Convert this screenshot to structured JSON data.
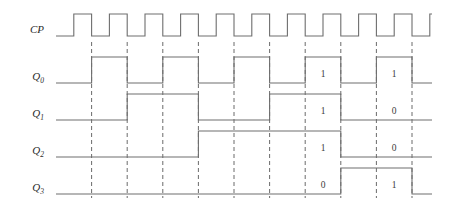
{
  "figure": {
    "kind": "digital-timing-diagram",
    "width": 454,
    "height": 209,
    "background_color": "#ffffff",
    "wave_color": "#6e6e6e",
    "guide_color": "#5a5a5a",
    "text_color": "#2b2b2b"
  },
  "chart_data": {
    "type": "line",
    "title": "",
    "xlabel": "",
    "ylabel": "",
    "grid": false,
    "legend": "none",
    "clock_periods": 11,
    "signals": [
      {
        "name": "CP",
        "label": "CP",
        "subscript": "",
        "row": 0,
        "kind": "clock",
        "duty": 0.5,
        "initial": 0,
        "values": [
          0,
          1,
          0,
          1,
          0,
          1,
          0,
          1,
          0,
          1,
          0,
          1,
          0,
          1,
          0,
          1,
          0,
          1,
          0,
          1,
          0,
          1,
          0
        ]
      },
      {
        "name": "Q0",
        "label": "Q",
        "subscript": "0",
        "row": 1,
        "kind": "toggle",
        "divide_by": 2,
        "initial": 0,
        "values": [
          0,
          1,
          0,
          1,
          0,
          1,
          0,
          1,
          0,
          1,
          0
        ],
        "annotations": [
          {
            "text": "1",
            "clock_index": 7
          },
          {
            "text": "1",
            "clock_index": 9
          }
        ]
      },
      {
        "name": "Q1",
        "label": "Q",
        "subscript": "1",
        "row": 2,
        "kind": "toggle",
        "divide_by": 4,
        "initial": 0,
        "values": [
          0,
          0,
          1,
          1,
          0,
          0,
          1,
          1,
          0,
          0,
          0
        ],
        "annotations": [
          {
            "text": "1",
            "clock_index": 7
          },
          {
            "text": "0",
            "clock_index": 9
          }
        ]
      },
      {
        "name": "Q2",
        "label": "Q",
        "subscript": "2",
        "row": 3,
        "kind": "toggle",
        "divide_by": 8,
        "initial": 0,
        "values": [
          0,
          0,
          0,
          0,
          1,
          1,
          1,
          1,
          0,
          0,
          0
        ],
        "annotations": [
          {
            "text": "1",
            "clock_index": 7
          },
          {
            "text": "0",
            "clock_index": 9
          }
        ]
      },
      {
        "name": "Q3",
        "label": "Q",
        "subscript": "3",
        "row": 4,
        "kind": "toggle",
        "divide_by": 16,
        "initial": 0,
        "values": [
          0,
          0,
          0,
          0,
          0,
          0,
          0,
          0,
          1,
          1,
          0
        ],
        "annotations": [
          {
            "text": "0",
            "clock_index": 7
          },
          {
            "text": "1",
            "clock_index": 9
          }
        ]
      }
    ],
    "guide_clock_indices": [
      1,
      2,
      3,
      4,
      5,
      6,
      7,
      8,
      9,
      10
    ]
  },
  "labels": {
    "cp": "CP",
    "q_base": "Q",
    "q0_sub": "0",
    "q1_sub": "1",
    "q2_sub": "2",
    "q3_sub": "3"
  }
}
